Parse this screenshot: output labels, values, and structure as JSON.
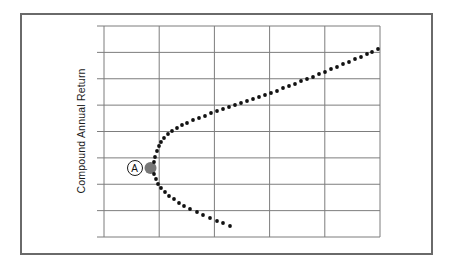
{
  "figure": {
    "kind": "scatter-figure",
    "frame": {
      "left": 20,
      "top": 13,
      "width": 413,
      "height": 242
    }
  },
  "colors": {
    "background": "#ffffff",
    "frame_border": "#6a6a6a",
    "grid": "#7d7d7d",
    "dot": "#111111",
    "vertex_fill": "#777777",
    "text": "#1a1a1a"
  },
  "chart_data": {
    "type": "scatter",
    "title": "",
    "xlabel": "",
    "ylabel": "Compound Annual Return",
    "grid": {
      "on": true,
      "columns": 5,
      "rows": 8
    },
    "axis_ticks": "unlabeled gridlines only; horizontal lines carry short tick overhangs left of the plot",
    "layout": {
      "plot": {
        "left": 104,
        "top": 26,
        "right": 380,
        "bottom": 237
      },
      "tick_overhang": 7,
      "dot_radius": 1.9,
      "ylabel_center": {
        "x": 81,
        "y": 131
      }
    },
    "marked_point": {
      "label": "A",
      "dot": {
        "cx": 150.5,
        "cy": 168,
        "r": 6
      },
      "badge": {
        "cx": 134.5,
        "cy": 168,
        "r": 8
      }
    },
    "series": [
      {
        "name": "frontier-dots-upper-branch",
        "points": [
          [
            154,
            162
          ],
          [
            155,
            157
          ],
          [
            157,
            151
          ],
          [
            159,
            146
          ],
          [
            161,
            142
          ],
          [
            164,
            138
          ],
          [
            168,
            134
          ],
          [
            172,
            131
          ],
          [
            177,
            128
          ],
          [
            182,
            125
          ],
          [
            187,
            123
          ],
          [
            193,
            120
          ],
          [
            199,
            118
          ],
          [
            205,
            116
          ],
          [
            211,
            113
          ],
          [
            217,
            111
          ],
          [
            223,
            109
          ],
          [
            229,
            107
          ],
          [
            235,
            105
          ],
          [
            241,
            103
          ],
          [
            247,
            101
          ],
          [
            253,
            99
          ],
          [
            259,
            97
          ],
          [
            265,
            95
          ],
          [
            271,
            93
          ],
          [
            277,
            91
          ],
          [
            283,
            88
          ],
          [
            289,
            86
          ],
          [
            295,
            84
          ],
          [
            301,
            81
          ],
          [
            307,
            79
          ],
          [
            313,
            77
          ],
          [
            319,
            74
          ],
          [
            325,
            72
          ],
          [
            331,
            69
          ],
          [
            337,
            67
          ],
          [
            343,
            64
          ],
          [
            349,
            62
          ],
          [
            355,
            59
          ],
          [
            361,
            57
          ],
          [
            367,
            54
          ],
          [
            372,
            52
          ],
          [
            378,
            49
          ]
        ]
      },
      {
        "name": "frontier-dots-lower-branch",
        "points": [
          [
            154,
            174
          ],
          [
            156,
            179
          ],
          [
            158,
            184
          ],
          [
            161,
            188
          ],
          [
            165,
            192
          ],
          [
            169,
            196
          ],
          [
            174,
            199
          ],
          [
            179,
            203
          ],
          [
            184,
            206
          ],
          [
            190,
            209
          ],
          [
            197,
            212
          ],
          [
            203,
            215
          ],
          [
            210,
            218
          ],
          [
            217,
            221
          ],
          [
            223,
            223
          ],
          [
            230,
            226
          ]
        ]
      }
    ]
  }
}
